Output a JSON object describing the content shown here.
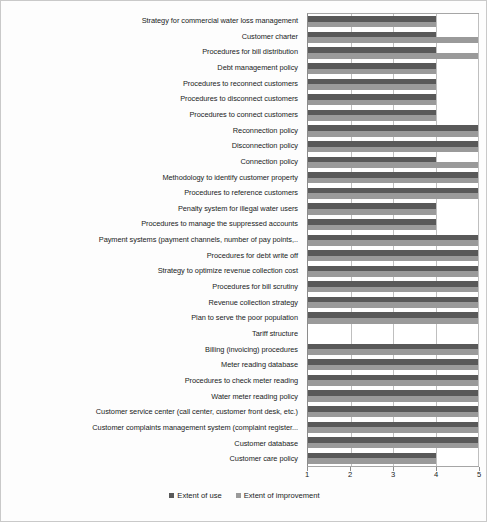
{
  "chart_data": {
    "type": "bar",
    "orientation": "horizontal",
    "title": "",
    "xlabel": "",
    "ylabel": "",
    "xlim": [
      1,
      5
    ],
    "xticks": [
      "1",
      "2",
      "3",
      "4",
      "5"
    ],
    "grid": true,
    "legend_position": "bottom",
    "legend": [
      "Extent of use",
      "Extent of improvement"
    ],
    "colors": {
      "extent_of_use": "#595959",
      "extent_of_improvement": "#9a9a9a",
      "gridline": "#bfbfbf",
      "axis": "#8c8c8c",
      "background": "#ffffff"
    },
    "categories": [
      "Strategy for commercial water loss management",
      "Customer charter",
      "Procedures for bill distribution",
      "Debt management policy",
      "Procedures to reconnect customers",
      "Procedures to disconnect customers",
      "Procedures to connect customers",
      "Reconnection policy",
      "Disconnection policy",
      "Connection policy",
      "Methodology to identify customer property",
      "Procedures to reference customers",
      "Penalty system  for illegal water users",
      "Procedures to manage the suppressed accounts",
      "Payment systems (payment channels, number of pay points,..",
      "Procedures for debt write off",
      "Strategy to optimize revenue collection cost",
      "Procedures for bill scrutiny",
      "Revenue collection strategy",
      "Plan to serve the poor population",
      "Tariff structure",
      "Billing (invoicing) procedures",
      "Meter reading database",
      "Procedures to check meter reading",
      "Water meter reading policy",
      "Customer service center (call center, customer front desk, etc.)",
      "Customer complaints management system (complaint register...",
      "Customer database",
      "Customer care policy"
    ],
    "series": [
      {
        "name": "Extent of use",
        "values": [
          4,
          4,
          4,
          4,
          4,
          4,
          4,
          5,
          5,
          4,
          5,
          5,
          4,
          4,
          5,
          5,
          5,
          5,
          5,
          5,
          1,
          5,
          5,
          5,
          5,
          5,
          5,
          5,
          4
        ]
      },
      {
        "name": "Extent of improvement",
        "values": [
          4,
          5,
          5,
          4,
          4,
          4,
          4,
          5,
          5,
          5,
          5,
          5,
          4,
          4,
          5,
          5,
          5,
          5,
          5,
          5,
          1,
          5,
          5,
          5,
          5,
          5,
          5,
          5,
          4
        ]
      }
    ]
  },
  "legend": {
    "items": [
      {
        "label": "Extent of use",
        "swatch": "use"
      },
      {
        "label": "Extent of improvement",
        "swatch": "imp"
      }
    ]
  }
}
